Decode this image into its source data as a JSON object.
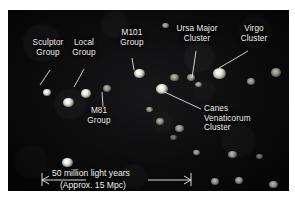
{
  "figure": {
    "frame": {
      "background_color": "#0c0c0d",
      "border_color": "#ffffff"
    }
  },
  "labels": [
    {
      "id": "sculptor",
      "name": "sculptor-group-label",
      "line1": "Sculptor",
      "line2": "Group"
    },
    {
      "id": "local",
      "name": "local-group-label",
      "line1": "Local",
      "line2": "Group"
    },
    {
      "id": "m101",
      "name": "m101-group-label",
      "line1": "M101",
      "line2": "Group"
    },
    {
      "id": "ursamajor",
      "name": "ursa-major-cluster-label",
      "line1": "Ursa Major",
      "line2": "Cluster"
    },
    {
      "id": "virgo",
      "name": "virgo-cluster-label",
      "line1": "Virgo",
      "line2": "Cluster"
    },
    {
      "id": "m81",
      "name": "m81-group-label",
      "line1": "M81",
      "line2": "Group"
    },
    {
      "id": "canes",
      "name": "canes-venaticorum-cluster-label",
      "line1": "Canes",
      "line2": "Venaticorum",
      "line3": "Cluster"
    }
  ],
  "scale_bar": {
    "primary_text": "50 million light years",
    "secondary_text": "(Approx. 15 Mpc)",
    "value": 50,
    "unit": "million light years",
    "equivalent_value": 15,
    "equivalent_unit": "Mpc"
  },
  "chart_data": {
    "type": "scatter",
    "xlabel": "",
    "ylabel": "",
    "grid": false,
    "legend_position": "none",
    "annotations": [
      {
        "text": "Sculptor Group",
        "x": 40,
        "y": 55
      },
      {
        "text": "Local Group",
        "x": 81,
        "y": 50
      },
      {
        "text": "M101 Group",
        "x": 127,
        "y": 38
      },
      {
        "text": "Ursa Major Cluster",
        "x": 189,
        "y": 31
      },
      {
        "text": "Virgo Cluster",
        "x": 243,
        "y": 31
      },
      {
        "text": "M81 Group",
        "x": 97,
        "y": 104
      },
      {
        "text": "Canes Venaticorum Cluster",
        "x": 213,
        "y": 105
      },
      {
        "text": "50 million light years",
        "x": 110,
        "y": 168
      },
      {
        "text": "(Approx. 15 Mpc)",
        "x": 110,
        "y": 180
      }
    ],
    "points": [
      {
        "x": 39,
        "y": 83,
        "size": 8,
        "brightness": 0.95,
        "label": "Sculptor Group"
      },
      {
        "x": 78,
        "y": 84,
        "size": 10,
        "brightness": 1.0,
        "label": "Local Group"
      },
      {
        "x": 60,
        "y": 93,
        "size": 11,
        "brightness": 0.95,
        "label": ""
      },
      {
        "x": 99,
        "y": 79,
        "size": 8,
        "brightness": 0.9,
        "label": "M81 Group"
      },
      {
        "x": 131,
        "y": 64,
        "size": 11,
        "brightness": 1.0,
        "label": "M101 Group"
      },
      {
        "x": 157,
        "y": 16,
        "size": 7,
        "brightness": 0.8,
        "label": ""
      },
      {
        "x": 166,
        "y": 68,
        "size": 9,
        "brightness": 0.9,
        "label": ""
      },
      {
        "x": 183,
        "y": 68,
        "size": 8,
        "brightness": 0.85,
        "label": ""
      },
      {
        "x": 190,
        "y": 75,
        "size": 7,
        "brightness": 0.8,
        "label": "Ursa Major Cluster"
      },
      {
        "x": 211,
        "y": 64,
        "size": 13,
        "brightness": 1.0,
        "label": "Virgo Cluster"
      },
      {
        "x": 243,
        "y": 72,
        "size": 8,
        "brightness": 0.85,
        "label": ""
      },
      {
        "x": 268,
        "y": 63,
        "size": 10,
        "brightness": 0.9,
        "label": ""
      },
      {
        "x": 154,
        "y": 80,
        "size": 12,
        "brightness": 1.0,
        "label": "Canes Venaticorum Cluster"
      },
      {
        "x": 141,
        "y": 100,
        "size": 7,
        "brightness": 0.8,
        "label": ""
      },
      {
        "x": 152,
        "y": 112,
        "size": 8,
        "brightness": 0.85,
        "label": ""
      },
      {
        "x": 171,
        "y": 119,
        "size": 9,
        "brightness": 0.85,
        "label": ""
      },
      {
        "x": 165,
        "y": 128,
        "size": 7,
        "brightness": 0.75,
        "label": ""
      },
      {
        "x": 188,
        "y": 143,
        "size": 7,
        "brightness": 0.8,
        "label": ""
      },
      {
        "x": 224,
        "y": 145,
        "size": 9,
        "brightness": 0.85,
        "label": ""
      },
      {
        "x": 251,
        "y": 147,
        "size": 7,
        "brightness": 0.75,
        "label": ""
      },
      {
        "x": 59,
        "y": 153,
        "size": 11,
        "brightness": 0.95,
        "label": ""
      },
      {
        "x": 207,
        "y": 172,
        "size": 8,
        "brightness": 0.85,
        "label": ""
      },
      {
        "x": 231,
        "y": 171,
        "size": 8,
        "brightness": 0.85,
        "label": ""
      },
      {
        "x": 265,
        "y": 175,
        "size": 9,
        "brightness": 0.9,
        "label": ""
      }
    ]
  }
}
